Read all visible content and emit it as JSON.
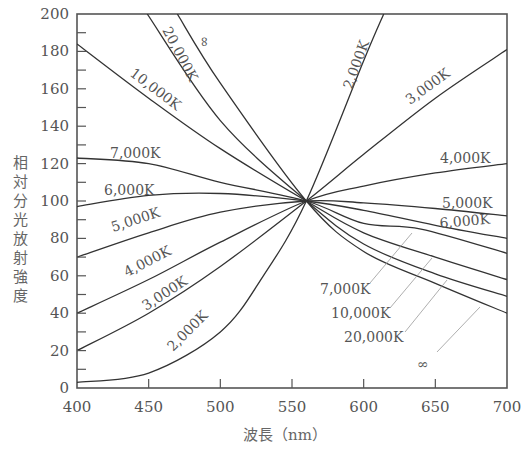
{
  "chart_data": {
    "type": "line",
    "title": "",
    "xlabel": "波長（nm）",
    "ylabel": "相対分光放射強度",
    "xlim": [
      400,
      700
    ],
    "ylim": [
      0,
      200
    ],
    "xticks": [
      400,
      450,
      500,
      550,
      600,
      650,
      700
    ],
    "yticks": [
      0,
      20,
      40,
      60,
      80,
      100,
      120,
      140,
      160,
      180,
      200
    ],
    "grid": false,
    "legend": "inline labels on curves",
    "series": [
      {
        "name": "2,000K",
        "x": [
          400,
          450,
          500,
          530,
          560,
          600,
          614
        ],
        "y": [
          3,
          8,
          30,
          60,
          100,
          175,
          200
        ]
      },
      {
        "name": "3,000K",
        "x": [
          400,
          450,
          500,
          560,
          600,
          650,
          700
        ],
        "y": [
          20,
          40,
          65,
          100,
          125,
          155,
          181
        ]
      },
      {
        "name": "4,000K",
        "x": [
          400,
          450,
          500,
          560,
          600,
          650,
          700
        ],
        "y": [
          40,
          58,
          78,
          100,
          108,
          115,
          120
        ]
      },
      {
        "name": "5,000K",
        "x": [
          400,
          450,
          500,
          560,
          600,
          650,
          700
        ],
        "y": [
          70,
          83,
          94,
          100,
          99,
          96,
          92
        ]
      },
      {
        "name": "6,000K",
        "x": [
          400,
          450,
          500,
          560,
          600,
          650,
          700
        ],
        "y": [
          97,
          103,
          104,
          100,
          95,
          87,
          80
        ]
      },
      {
        "name": "7,000K",
        "x": [
          400,
          450,
          500,
          560,
          600,
          640,
          700
        ],
        "y": [
          123,
          120,
          110,
          100,
          88,
          85,
          72
        ]
      },
      {
        "name": "10,000K",
        "x": [
          400,
          450,
          500,
          560,
          600,
          650,
          700
        ],
        "y": [
          184,
          155,
          128,
          100,
          83,
          70,
          58
        ]
      },
      {
        "name": "20,000K",
        "x": [
          449,
          500,
          560,
          600,
          650,
          700
        ],
        "y": [
          200,
          143,
          100,
          77,
          61,
          49
        ]
      },
      {
        "name": "∞",
        "x": [
          470,
          500,
          560,
          600,
          650,
          700
        ],
        "y": [
          200,
          163,
          100,
          73,
          56,
          40
        ]
      }
    ],
    "annotations": [
      "Curves converge at ~560 nm, value 100"
    ]
  },
  "labels": {
    "xlabel": "波長（nm）",
    "ylabel_chars": [
      "相",
      "対",
      "分",
      "光",
      "放",
      "射",
      "強",
      "度"
    ],
    "curve_labels": {
      "k2000_top": "2,000K",
      "k3000_top": "3,000K",
      "k4000_right": "4,000K",
      "k5000_right": "5,000K",
      "k6000_right": "6,000K",
      "k7000_left": "7,000K",
      "k6000_left": "6,000K",
      "k5000_left": "5,000K",
      "k4000_left": "4,000K",
      "k3000_left": "3,000K",
      "k2000_left": "2,000K",
      "k10000_left": "10,000K",
      "k20000_left": "20,000K",
      "inf_top": "∞",
      "k7000_callout": "7,000K",
      "k10000_callout": "10,000K",
      "k20000_callout": "20,000K",
      "inf_callout": "∞"
    }
  },
  "colors": {
    "line": "#333333",
    "axis": "#555555",
    "text": "#555555",
    "leader": "#888888"
  }
}
